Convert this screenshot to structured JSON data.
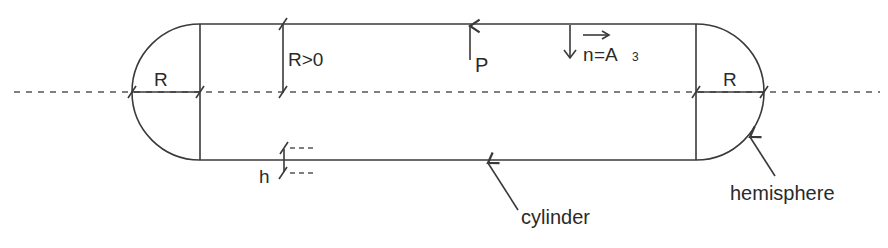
{
  "figure": {
    "labels": {
      "left_radius": "R",
      "right_radius": "R",
      "radius_condition": "R>0",
      "pressure": "P",
      "normal_vector_name": "n",
      "normal_vector_eq": "=A",
      "normal_vector_subscript": "3",
      "thickness": "h",
      "cylinder": "cylinder",
      "hemisphere": "hemisphere"
    },
    "colors": {
      "line": "#3a3a3a",
      "text": "#2a2a2a",
      "background": "#ffffff"
    }
  }
}
